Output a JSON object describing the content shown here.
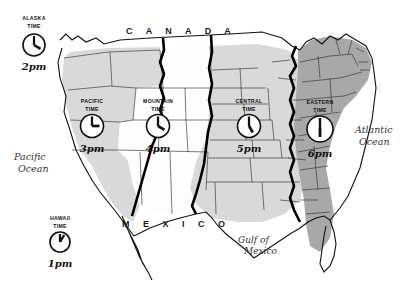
{
  "map": {
    "title": "United States Time Zones",
    "style": "hand-drawn sketch map",
    "background_color": "#ffffff",
    "ink_color": "#111111"
  },
  "countries": [
    {
      "name": "CANADA",
      "label": "C A N A D A",
      "position": "top"
    },
    {
      "name": "MEXICO",
      "label": "M E X I C O",
      "position": "bottom-left"
    }
  ],
  "oceans": [
    {
      "name": "pacific-ocean",
      "line1": "Pacific",
      "line2": "Ocean",
      "position": "left"
    },
    {
      "name": "atlantic-ocean",
      "line1": "Atlantic",
      "line2": "Ocean",
      "position": "right"
    },
    {
      "name": "gulf-of-mexico",
      "line1": "Gulf of",
      "line2": "Mexico",
      "position": "bottom-center"
    }
  ],
  "time_zones": [
    {
      "id": "alaska",
      "name_line1": "ALASKA",
      "name_line2": "TIME",
      "time": "2pm",
      "hour": 2,
      "minute": 0,
      "shade": "none",
      "inset": true
    },
    {
      "id": "hawaii",
      "name_line1": "HAWAII",
      "name_line2": "TIME",
      "time": "1pm",
      "hour": 1,
      "minute": 0,
      "shade": "none",
      "inset": true
    },
    {
      "id": "pacific",
      "name_line1": "PACIFIC",
      "name_line2": "TIME",
      "time": "3pm",
      "hour": 3,
      "minute": 0,
      "shade": "light-gray",
      "inset": false
    },
    {
      "id": "mountain",
      "name_line1": "MOUNTAIN",
      "name_line2": "TIME",
      "time": "4pm",
      "hour": 4,
      "minute": 0,
      "shade": "white",
      "inset": false
    },
    {
      "id": "central",
      "name_line1": "CENTRAL",
      "name_line2": "TIME",
      "time": "5pm",
      "hour": 5,
      "minute": 0,
      "shade": "light-gray",
      "inset": false
    },
    {
      "id": "eastern",
      "name_line1": "EASTERN",
      "name_line2": "TIME",
      "time": "6pm",
      "hour": 6,
      "minute": 0,
      "shade": "medium-gray",
      "inset": false
    }
  ],
  "colors": {
    "light_gray": "#d9d9d9",
    "medium_gray": "#a8a8a8",
    "white_zone": "#fdfdfd",
    "ink": "#111111",
    "state_line": "#333333"
  }
}
